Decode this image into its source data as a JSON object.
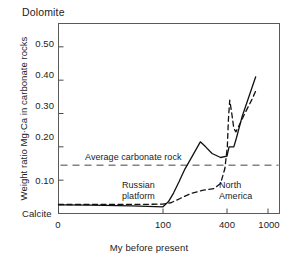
{
  "chart_data": {
    "type": "line",
    "title": "",
    "xlabel": "My before present",
    "ylabel": "Weight ratio Mg·Ca in carbonate rocks",
    "top_axis_label": "Dolomite",
    "bottom_axis_label": "Calcite",
    "xticks": [
      "0",
      "100",
      "400",
      "1000"
    ],
    "xtick_values": [
      0,
      100,
      400,
      1000
    ],
    "yticks": [
      "0.10",
      "0.20",
      "0.30",
      "0.40",
      "0.50"
    ],
    "ytick_values": [
      0.1,
      0.2,
      0.3,
      0.4,
      0.5
    ],
    "ylim": [
      0.0,
      0.57
    ],
    "xlim": [
      0,
      1000
    ],
    "grid": false,
    "legend": "none",
    "annotations": [
      {
        "name": "average-carbonate-rock",
        "text": "Average carbonate rock",
        "value": 0.145
      },
      {
        "name": "russian-platform",
        "text": "Russian\nplatform",
        "line1": "Russian",
        "line2": "platform"
      },
      {
        "name": "north-america",
        "text": "North\nAmerica",
        "line1": "North",
        "line2": "America"
      }
    ],
    "reference_line": {
      "label": "Average carbonate rock",
      "value": 0.145,
      "style": "dashed"
    },
    "series": [
      {
        "name": "Russian platform",
        "style": "solid",
        "color": "#111111",
        "points": [
          [
            0,
            0.026
          ],
          [
            30,
            0.025
          ],
          [
            70,
            0.023
          ],
          [
            100,
            0.02
          ],
          [
            125,
            0.035
          ],
          [
            150,
            0.062
          ],
          [
            175,
            0.095
          ],
          [
            200,
            0.13
          ],
          [
            240,
            0.175
          ],
          [
            275,
            0.215
          ],
          [
            300,
            0.2
          ],
          [
            330,
            0.18
          ],
          [
            370,
            0.168
          ],
          [
            400,
            0.172
          ],
          [
            430,
            0.2
          ],
          [
            500,
            0.2
          ],
          [
            540,
            0.228
          ],
          [
            620,
            0.29
          ],
          [
            720,
            0.35
          ],
          [
            820,
            0.41
          ]
        ]
      },
      {
        "name": "North America",
        "style": "dashed",
        "color": "#111111",
        "points": [
          [
            0,
            0.027
          ],
          [
            60,
            0.027
          ],
          [
            100,
            0.028
          ],
          [
            140,
            0.033
          ],
          [
            180,
            0.045
          ],
          [
            230,
            0.06
          ],
          [
            290,
            0.07
          ],
          [
            340,
            0.075
          ],
          [
            370,
            0.09
          ],
          [
            390,
            0.135
          ],
          [
            405,
            0.2
          ],
          [
            420,
            0.28
          ],
          [
            440,
            0.34
          ],
          [
            470,
            0.3
          ],
          [
            500,
            0.255
          ],
          [
            530,
            0.245
          ],
          [
            580,
            0.265
          ],
          [
            660,
            0.3
          ],
          [
            760,
            0.34
          ],
          [
            830,
            0.372
          ]
        ]
      }
    ]
  }
}
